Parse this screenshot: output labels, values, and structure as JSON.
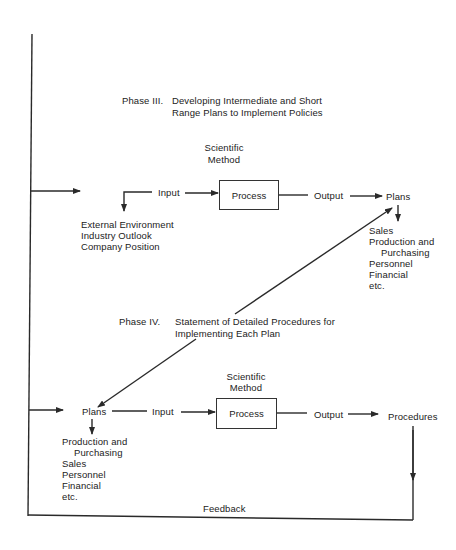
{
  "phase3": {
    "label": "Phase III.",
    "title_line1": "Developing Intermediate and Short",
    "title_line2": "Range Plans to Implement Policies",
    "method_line1": "Scientific",
    "method_line2": "Method",
    "input": "Input",
    "process": "Process",
    "output": "Output",
    "plans": "Plans",
    "sources": [
      "External Environment",
      "Industry Outlook",
      "Company Position"
    ],
    "plan_items": [
      "Sales",
      "Production and",
      "Purchasing",
      "Personnel",
      "Financial",
      "etc."
    ]
  },
  "phase4": {
    "label": "Phase IV.",
    "title_line1": "Statement of Detailed Procedures for",
    "title_line2": "Implementing Each Plan",
    "method_line1": "Scientific",
    "method_line2": "Method",
    "plans": "Plans",
    "input": "Input",
    "process": "Process",
    "output": "Output",
    "procedures": "Procedures",
    "plan_items": [
      "Production and",
      "Purchasing",
      "Sales",
      "Personnel",
      "Financial",
      "etc."
    ]
  },
  "feedback": "Feedback",
  "colors": {
    "line": "#2a2a2a",
    "text": "#222222",
    "background": "#ffffff"
  }
}
